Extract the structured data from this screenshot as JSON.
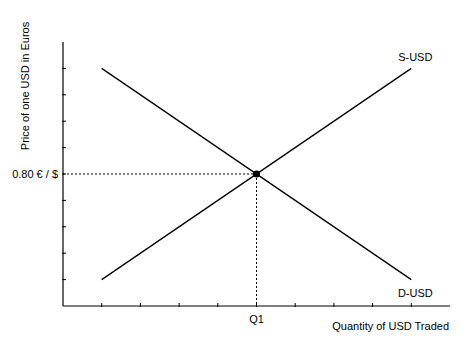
{
  "chart_data": {
    "type": "line",
    "title": "",
    "xlabel": "Quantity of USD Traded",
    "ylabel": "Price of one USD in Euros",
    "xlim": [
      0,
      10
    ],
    "ylim": [
      0,
      10
    ],
    "x_ticks": [
      1,
      2,
      3,
      4,
      5,
      6,
      7,
      8,
      9
    ],
    "y_ticks": [
      1,
      2,
      3,
      4,
      5,
      6,
      7,
      8,
      9
    ],
    "grid": false,
    "series": [
      {
        "name": "S-USD",
        "label": "S-USD",
        "label_position": "end-above",
        "x": [
          1,
          9
        ],
        "y": [
          1,
          9
        ]
      },
      {
        "name": "D-USD",
        "label": "D-USD",
        "label_position": "end-below",
        "x": [
          1,
          9
        ],
        "y": [
          9,
          1
        ]
      }
    ],
    "equilibrium": {
      "x": 5,
      "y": 5,
      "x_label": "Q1",
      "y_label": "0.80 € / $"
    }
  }
}
